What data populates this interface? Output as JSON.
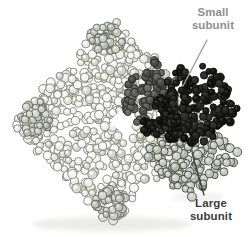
{
  "canvas": {
    "width": 250,
    "height": 237,
    "background": "#ffffff"
  },
  "figure_labels": {
    "small_subunit": {
      "line1": "Small",
      "line2": "subunit",
      "color": "#8f8f8f"
    },
    "large_subunit": {
      "line1": "Large",
      "line2": "subunit",
      "color": "#3c3c3c"
    }
  },
  "leader_lines": [
    {
      "name": "small-subunit-leader-line",
      "x1": 207,
      "y1": 40,
      "x2": 183,
      "y2": 86,
      "color": "#9b9b9b",
      "width": 1.3
    },
    {
      "name": "large-subunit-leader-line",
      "x1": 204,
      "y1": 195,
      "x2": 192,
      "y2": 153,
      "color": "#3c3c3c",
      "width": 1.3
    }
  ],
  "molecule": {
    "seed": 1337,
    "shadows": [
      {
        "cx": 112,
        "cy": 224,
        "rx": 80,
        "ry": 7,
        "fill": "#e6e6e2",
        "opacity": 0.8
      },
      {
        "cx": 198,
        "cy": 197,
        "rx": 26,
        "ry": 5,
        "fill": "#e8e8e4",
        "opacity": 0.6
      }
    ],
    "clusters": [
      {
        "name": "main-complex",
        "cx": 112,
        "cy": 122,
        "rx": 100,
        "ry": 104,
        "p": 1,
        "count": 620,
        "rmin": 3.2,
        "rmax": 4.7,
        "edge": 0.12,
        "stroke": "#73736d",
        "sw": 0.8,
        "fills": [
          "#f3f4ee",
          "#f3f4ee",
          "#eceee6",
          "#eceee6",
          "#f7f8f3",
          "#e2e4da",
          "#d7dacd",
          "#cfd3c6"
        ],
        "hl": "#ffffff",
        "hlo": 0.85
      },
      {
        "name": "pale-subunit-patch-top",
        "cx": 107,
        "cy": 40,
        "rx": 18,
        "ry": 15,
        "p": 1.6,
        "count": 42,
        "rmin": 3,
        "rmax": 4.3,
        "edge": 0.3,
        "stroke": "#5c5c56",
        "sw": 0.8,
        "fills": [
          "#c9ccc1",
          "#c0c4b8",
          "#d2d5ca",
          "#b8bcb0"
        ],
        "hl": "#e8eae1",
        "hlo": 0.8
      },
      {
        "name": "pale-subunit-patch-left",
        "cx": 36,
        "cy": 120,
        "rx": 16,
        "ry": 20,
        "p": 1.6,
        "count": 40,
        "rmin": 3,
        "rmax": 4.3,
        "edge": 0.3,
        "stroke": "#5c5c56",
        "sw": 0.8,
        "fills": [
          "#c9ccc1",
          "#c0c4b8",
          "#d2d5ca",
          "#b8bcb0"
        ],
        "hl": "#e8eae1",
        "hlo": 0.8
      },
      {
        "name": "pale-subunit-patch-bottom",
        "cx": 112,
        "cy": 203,
        "rx": 18,
        "ry": 15,
        "p": 1.6,
        "count": 40,
        "rmin": 3,
        "rmax": 4.3,
        "edge": 0.3,
        "stroke": "#5c5c56",
        "sw": 0.8,
        "fills": [
          "#c9ccc1",
          "#c0c4b8",
          "#d2d5ca",
          "#b8bcb0"
        ],
        "hl": "#e8eae1",
        "hlo": 0.8
      },
      {
        "name": "central-gap",
        "type": "gap",
        "cx": 123,
        "cy": 121,
        "r": 9.5,
        "fill": "#ffffff"
      },
      {
        "name": "large-subunit-cluster",
        "cx": 192,
        "cy": 154,
        "rx": 46,
        "ry": 43,
        "p": 1.25,
        "count": 175,
        "rmin": 3.2,
        "rmax": 4.5,
        "edge": 0.15,
        "stroke": "#45453f",
        "sw": 0.9,
        "fills": [
          "#c7cabf",
          "#bec2b6",
          "#d0d3c8",
          "#b4b8ac",
          "#cdd0c5"
        ],
        "hl": "#e2e5da",
        "hlo": 0.8
      },
      {
        "name": "small-subunit-shaded-part",
        "cx": 152,
        "cy": 96,
        "rx": 30,
        "ry": 37,
        "p": 1.4,
        "count": 95,
        "rmin": 3,
        "rmax": 4.3,
        "edge": 0.2,
        "stroke": "#262622",
        "sw": 0.9,
        "fills": [
          "#5f5f5b",
          "#545450",
          "#6a6a65",
          "#4b4b47"
        ],
        "hl": "#80807a",
        "hlo": 0.5
      },
      {
        "name": "small-subunit-lower-lobe",
        "cx": 162,
        "cy": 127,
        "rx": 20,
        "ry": 17,
        "p": 1.5,
        "count": 38,
        "rmin": 3,
        "rmax": 4.2,
        "edge": 0.2,
        "stroke": "#0c0c0a",
        "sw": 0.9,
        "fills": [
          "#23231f",
          "#1a1a17",
          "#2d2d29",
          "#111110"
        ],
        "hl": "#45453e",
        "hlo": 0.5
      },
      {
        "name": "small-subunit-dark-part",
        "cx": 197,
        "cy": 103,
        "rx": 44,
        "ry": 44,
        "p": 1.25,
        "count": 160,
        "rmin": 3,
        "rmax": 4.3,
        "edge": 0.15,
        "stroke": "#0c0c0a",
        "sw": 0.9,
        "fills": [
          "#23231f",
          "#1a1a17",
          "#2d2d29",
          "#111110"
        ],
        "hl": "#45453e",
        "hlo": 0.5
      }
    ]
  }
}
